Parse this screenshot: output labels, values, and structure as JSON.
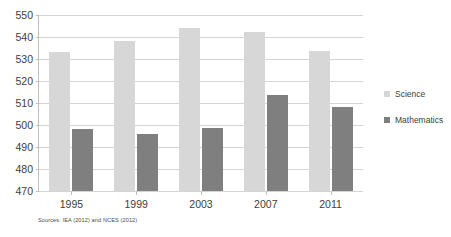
{
  "chart_data": {
    "type": "bar",
    "title": "",
    "categories": [
      "1995",
      "1999",
      "2003",
      "2007",
      "2011"
    ],
    "series": [
      {
        "name": "Science",
        "color": "#d7d7d7",
        "values": [
          533,
          538,
          544,
          542.5,
          533.5
        ]
      },
      {
        "name": "Mathematics",
        "color": "#7f7f7f",
        "values": [
          498,
          496,
          498.5,
          513.5,
          508
        ]
      }
    ],
    "xlabel": "",
    "ylabel": "",
    "ylim": [
      470,
      550
    ],
    "ytick_step": 10,
    "yticks": [
      550,
      540,
      530,
      520,
      510,
      500,
      490,
      480,
      470
    ],
    "grid": true,
    "legend_position": "right",
    "source_note": "Sources: IEA (2012) and NCES (2012)"
  },
  "legend": {
    "entries": [
      {
        "label": "Science"
      },
      {
        "label": "Mathematics"
      }
    ]
  },
  "footer": {
    "source": "Sources: IEA (2012) and NCES (2012)"
  }
}
